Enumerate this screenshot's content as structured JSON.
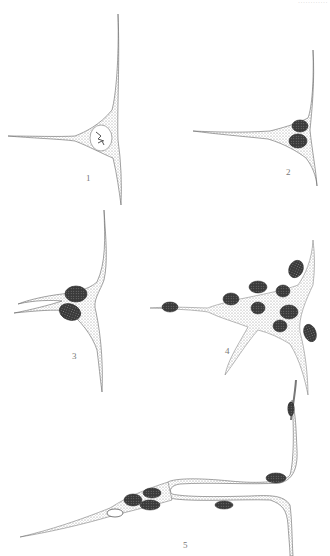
{
  "plate": {
    "header_text": "············",
    "background": "#ffffff",
    "stipple_color": "#8a8a8a",
    "nucleus_color": "#3a3a3a",
    "figures": [
      {
        "label": "1",
        "description": "triangular cell with single pale nucleus at junction of fibres"
      },
      {
        "label": "2",
        "description": "cell with two dark nuclei at fibre junction"
      },
      {
        "label": "3",
        "description": "cell with two dark nuclei at curved fibre junction"
      },
      {
        "label": "4",
        "description": "multinucleate cell mass with several oval nuclei and radiating processes"
      },
      {
        "label": "5",
        "description": "elongated cell strands with looped fibre and multiple nuclei"
      }
    ]
  }
}
